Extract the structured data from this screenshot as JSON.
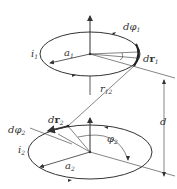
{
  "diagram": {
    "labels": {
      "d_phi1": "dφ",
      "d_phi1_sub": "1",
      "i1": "i",
      "i1_sub": "1",
      "a1": "a",
      "a1_sub": "1",
      "dr1_d": "d",
      "dr1_r": "r",
      "dr1_sub": "1",
      "r12": "r",
      "r12_sub": "12",
      "dr2_d": "d",
      "dr2_r": "r",
      "dr2_sub": "2",
      "d_phi2": "dφ",
      "d_phi2_sub": "2",
      "i2": "i",
      "i2_sub": "2",
      "phi2": "φ",
      "phi2_sub": "2",
      "a2": "a",
      "a2_sub": "2",
      "d": "d"
    },
    "colors": {
      "stroke": "#333333",
      "background": "#ffffff"
    }
  }
}
